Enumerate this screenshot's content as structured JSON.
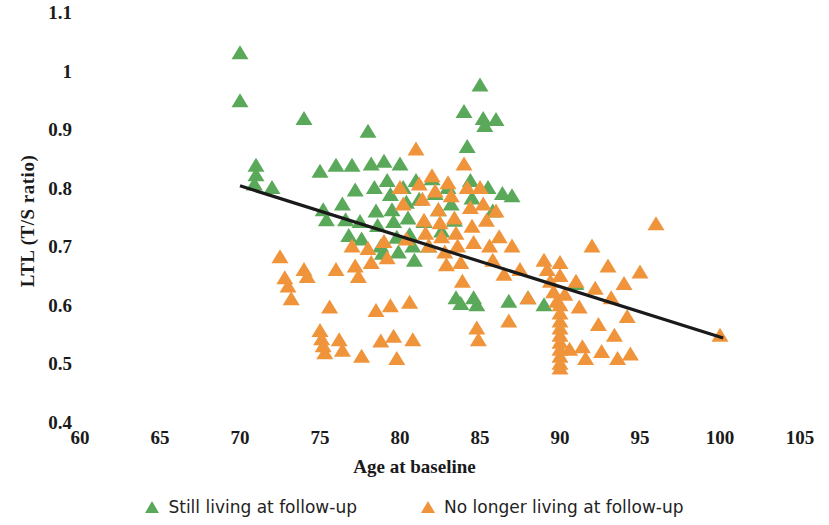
{
  "chart_data": {
    "type": "scatter",
    "title": "",
    "xlabel": "Age at baseline",
    "ylabel": "LTL (T/S ratio)",
    "xlim": [
      60,
      105
    ],
    "ylim": [
      0.4,
      1.1
    ],
    "xticks": [
      60,
      65,
      70,
      75,
      80,
      85,
      90,
      95,
      100,
      105
    ],
    "yticks": [
      "0.4",
      "0.5",
      "0.6",
      "0.7",
      "0.8",
      "0.9",
      "1",
      "1.1"
    ],
    "grid": false,
    "legend_position": "bottom",
    "series": [
      {
        "name": "Still living at follow-up",
        "color": "#5aa95a",
        "marker": "triangle",
        "points": [
          [
            70.0,
            1.03
          ],
          [
            70.0,
            0.948
          ],
          [
            71.0,
            0.838
          ],
          [
            71.0,
            0.822
          ],
          [
            70.9,
            0.806
          ],
          [
            72.0,
            0.8
          ],
          [
            74.0,
            0.918
          ],
          [
            75.0,
            0.828
          ],
          [
            75.2,
            0.762
          ],
          [
            75.4,
            0.745
          ],
          [
            76.0,
            0.838
          ],
          [
            76.4,
            0.772
          ],
          [
            76.6,
            0.745
          ],
          [
            76.8,
            0.718
          ],
          [
            77.0,
            0.838
          ],
          [
            77.2,
            0.796
          ],
          [
            77.5,
            0.742
          ],
          [
            77.6,
            0.712
          ],
          [
            78.0,
            0.896
          ],
          [
            78.2,
            0.84
          ],
          [
            78.4,
            0.8
          ],
          [
            78.5,
            0.76
          ],
          [
            78.6,
            0.735
          ],
          [
            78.8,
            0.7
          ],
          [
            78.9,
            0.688
          ],
          [
            79.0,
            0.845
          ],
          [
            79.2,
            0.812
          ],
          [
            79.4,
            0.788
          ],
          [
            79.5,
            0.762
          ],
          [
            79.6,
            0.742
          ],
          [
            79.8,
            0.715
          ],
          [
            79.9,
            0.69
          ],
          [
            80.0,
            0.84
          ],
          [
            80.2,
            0.8
          ],
          [
            80.4,
            0.775
          ],
          [
            80.5,
            0.748
          ],
          [
            80.6,
            0.72
          ],
          [
            80.8,
            0.7
          ],
          [
            80.9,
            0.676
          ],
          [
            81.0,
            0.812
          ],
          [
            81.2,
            0.78
          ],
          [
            81.5,
            0.742
          ],
          [
            81.8,
            0.7
          ],
          [
            82.0,
            0.815
          ],
          [
            82.2,
            0.79
          ],
          [
            82.4,
            0.762
          ],
          [
            82.6,
            0.726
          ],
          [
            83.0,
            0.8
          ],
          [
            83.2,
            0.772
          ],
          [
            83.4,
            0.744
          ],
          [
            83.5,
            0.612
          ],
          [
            83.8,
            0.602
          ],
          [
            84.0,
            0.93
          ],
          [
            84.2,
            0.87
          ],
          [
            84.4,
            0.812
          ],
          [
            84.5,
            0.782
          ],
          [
            84.6,
            0.612
          ],
          [
            84.8,
            0.6
          ],
          [
            85.0,
            0.975
          ],
          [
            85.2,
            0.918
          ],
          [
            85.3,
            0.906
          ],
          [
            85.5,
            0.8
          ],
          [
            85.8,
            0.76
          ],
          [
            86.0,
            0.916
          ],
          [
            86.4,
            0.79
          ],
          [
            86.8,
            0.606
          ],
          [
            87.0,
            0.786
          ],
          [
            88.0,
            0.612
          ],
          [
            89.0,
            0.6
          ],
          [
            91.0,
            0.636
          ]
        ]
      },
      {
        "name": "No longer living at follow-up",
        "color": "#f0943c",
        "marker": "triangle",
        "points": [
          [
            72.5,
            0.682
          ],
          [
            72.8,
            0.646
          ],
          [
            73.0,
            0.632
          ],
          [
            73.2,
            0.61
          ],
          [
            74.0,
            0.66
          ],
          [
            74.2,
            0.648
          ],
          [
            75.0,
            0.556
          ],
          [
            75.1,
            0.542
          ],
          [
            75.2,
            0.53
          ],
          [
            75.3,
            0.518
          ],
          [
            75.6,
            0.596
          ],
          [
            76.0,
            0.66
          ],
          [
            76.2,
            0.54
          ],
          [
            76.4,
            0.522
          ],
          [
            77.0,
            0.7
          ],
          [
            77.2,
            0.666
          ],
          [
            77.4,
            0.648
          ],
          [
            77.6,
            0.512
          ],
          [
            78.0,
            0.696
          ],
          [
            78.2,
            0.672
          ],
          [
            78.5,
            0.59
          ],
          [
            78.8,
            0.538
          ],
          [
            79.0,
            0.708
          ],
          [
            79.2,
            0.68
          ],
          [
            79.4,
            0.598
          ],
          [
            79.6,
            0.546
          ],
          [
            79.8,
            0.508
          ],
          [
            80.0,
            0.8
          ],
          [
            80.2,
            0.772
          ],
          [
            80.4,
            0.712
          ],
          [
            80.6,
            0.604
          ],
          [
            80.8,
            0.54
          ],
          [
            81.0,
            0.866
          ],
          [
            81.2,
            0.806
          ],
          [
            81.4,
            0.78
          ],
          [
            81.5,
            0.744
          ],
          [
            81.6,
            0.722
          ],
          [
            81.8,
            0.7
          ],
          [
            82.0,
            0.82
          ],
          [
            82.2,
            0.794
          ],
          [
            82.4,
            0.762
          ],
          [
            82.5,
            0.74
          ],
          [
            82.6,
            0.716
          ],
          [
            82.8,
            0.69
          ],
          [
            82.9,
            0.668
          ],
          [
            83.0,
            0.808
          ],
          [
            83.2,
            0.786
          ],
          [
            83.4,
            0.748
          ],
          [
            83.5,
            0.722
          ],
          [
            83.6,
            0.7
          ],
          [
            83.8,
            0.672
          ],
          [
            83.9,
            0.64
          ],
          [
            84.0,
            0.84
          ],
          [
            84.2,
            0.8
          ],
          [
            84.4,
            0.766
          ],
          [
            84.5,
            0.734
          ],
          [
            84.6,
            0.706
          ],
          [
            84.8,
            0.56
          ],
          [
            84.9,
            0.54
          ],
          [
            85.0,
            0.8
          ],
          [
            85.2,
            0.772
          ],
          [
            85.4,
            0.744
          ],
          [
            85.6,
            0.7
          ],
          [
            85.8,
            0.676
          ],
          [
            86.0,
            0.76
          ],
          [
            86.2,
            0.716
          ],
          [
            86.5,
            0.652
          ],
          [
            86.8,
            0.572
          ],
          [
            87.0,
            0.7
          ],
          [
            87.5,
            0.66
          ],
          [
            88.0,
            0.612
          ],
          [
            89.0,
            0.676
          ],
          [
            89.2,
            0.66
          ],
          [
            89.4,
            0.64
          ],
          [
            89.6,
            0.622
          ],
          [
            89.8,
            0.606
          ],
          [
            90.0,
            0.672
          ],
          [
            90.0,
            0.65
          ],
          [
            90.0,
            0.6
          ],
          [
            90.0,
            0.586
          ],
          [
            90.0,
            0.572
          ],
          [
            90.0,
            0.56
          ],
          [
            90.0,
            0.548
          ],
          [
            90.0,
            0.536
          ],
          [
            90.0,
            0.524
          ],
          [
            90.0,
            0.512
          ],
          [
            90.0,
            0.5
          ],
          [
            90.0,
            0.492
          ],
          [
            90.3,
            0.618
          ],
          [
            90.6,
            0.524
          ],
          [
            91.0,
            0.64
          ],
          [
            91.2,
            0.596
          ],
          [
            91.4,
            0.528
          ],
          [
            91.6,
            0.508
          ],
          [
            92.0,
            0.7
          ],
          [
            92.2,
            0.628
          ],
          [
            92.4,
            0.566
          ],
          [
            92.6,
            0.52
          ],
          [
            93.0,
            0.666
          ],
          [
            93.2,
            0.612
          ],
          [
            93.4,
            0.548
          ],
          [
            93.6,
            0.508
          ],
          [
            94.0,
            0.636
          ],
          [
            94.2,
            0.58
          ],
          [
            94.4,
            0.516
          ],
          [
            95.0,
            0.656
          ],
          [
            96.0,
            0.738
          ],
          [
            100.0,
            0.548
          ]
        ]
      }
    ],
    "trendline": {
      "color": "#1a1a1a",
      "x_start": 70.0,
      "y_start": 0.805,
      "x_end": 100.2,
      "y_end": 0.545
    }
  },
  "axis": {
    "y_title": "LTL (T/S ratio)",
    "x_title": "Age at baseline"
  },
  "legend": {
    "items": [
      {
        "label": "Still living at follow-up",
        "color": "#5aa95a"
      },
      {
        "label": "No longer living at follow-up",
        "color": "#f0943c"
      }
    ]
  }
}
